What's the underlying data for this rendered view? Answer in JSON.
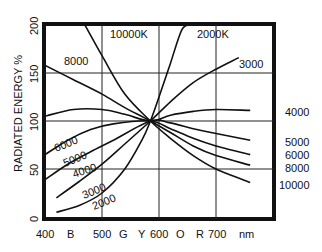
{
  "chart_data": {
    "type": "line",
    "title": "",
    "xlabel": "nm",
    "ylabel": "RADIATED ENERGY %",
    "xlim": [
      400,
      760
    ],
    "ylim": [
      0,
      200
    ],
    "grid": true,
    "x_ticks": [
      {
        "value": 400,
        "label": "400"
      },
      {
        "value": 450,
        "label": "B"
      },
      {
        "value": 500,
        "label": "500"
      },
      {
        "value": 530,
        "label": "G"
      },
      {
        "value": 570,
        "label": "Y"
      },
      {
        "value": 600,
        "label": "600"
      },
      {
        "value": 630,
        "label": "O"
      },
      {
        "value": 670,
        "label": "R"
      },
      {
        "value": 700,
        "label": "700"
      },
      {
        "value": 750,
        "label": "nm"
      }
    ],
    "y_ticks": [
      "0",
      "50",
      "100",
      "150",
      "200"
    ],
    "x_grid": [
      500,
      600,
      700
    ],
    "y_grid": [
      50,
      100,
      150
    ],
    "series": [
      {
        "name": "2000K",
        "label": "2000K",
        "points": [
          [
            420,
            5
          ],
          [
            460,
            12
          ],
          [
            500,
            25
          ],
          [
            540,
            50
          ],
          [
            570,
            80
          ],
          [
            585,
            100
          ],
          [
            600,
            125
          ],
          [
            620,
            160
          ],
          [
            640,
            195
          ],
          [
            655,
            200
          ]
        ]
      },
      {
        "name": "3000",
        "label": "3000",
        "points": [
          [
            420,
            20
          ],
          [
            460,
            37
          ],
          [
            500,
            55
          ],
          [
            540,
            76
          ],
          [
            585,
            100
          ],
          [
            620,
            120
          ],
          [
            660,
            140
          ],
          [
            700,
            154
          ],
          [
            740,
            166
          ]
        ]
      },
      {
        "name": "4000",
        "label": "4000",
        "points": [
          [
            400,
            105
          ],
          [
            450,
            112
          ],
          [
            500,
            112
          ],
          [
            540,
            107
          ],
          [
            585,
            100
          ],
          [
            620,
            106
          ],
          [
            660,
            110
          ],
          [
            700,
            112
          ],
          [
            760,
            111
          ]
        ]
      },
      {
        "name": "5000",
        "label": "5000",
        "points": [
          [
            400,
            39
          ],
          [
            440,
            55
          ],
          [
            480,
            68
          ],
          [
            520,
            80
          ],
          [
            585,
            100
          ],
          [
            620,
            98
          ],
          [
            660,
            92
          ],
          [
            700,
            87
          ],
          [
            760,
            80
          ]
        ]
      },
      {
        "name": "6000",
        "label": "6000",
        "points": [
          [
            400,
            65
          ],
          [
            440,
            80
          ],
          [
            480,
            91
          ],
          [
            520,
            97
          ],
          [
            585,
            100
          ],
          [
            620,
            92
          ],
          [
            660,
            82
          ],
          [
            700,
            74
          ],
          [
            760,
            65
          ]
        ]
      },
      {
        "name": "8000",
        "label": "8000",
        "points": [
          [
            400,
            158
          ],
          [
            450,
            143
          ],
          [
            500,
            128
          ],
          [
            540,
            114
          ],
          [
            585,
            100
          ],
          [
            620,
            88
          ],
          [
            660,
            74
          ],
          [
            700,
            64
          ],
          [
            760,
            54
          ]
        ]
      },
      {
        "name": "10000K",
        "label": "10000K",
        "points": [
          [
            470,
            200
          ],
          [
            500,
            168
          ],
          [
            540,
            128
          ],
          [
            585,
            100
          ],
          [
            620,
            82
          ],
          [
            660,
            64
          ],
          [
            700,
            50
          ],
          [
            760,
            36
          ]
        ]
      }
    ],
    "annotations": [
      {
        "text": "10000K",
        "position": "top"
      },
      {
        "text": "2000K",
        "position": "top-right"
      },
      {
        "text": "8000",
        "position": "upper-left"
      },
      {
        "text": "3000",
        "position": "upper-right"
      },
      {
        "text": "4000",
        "position": "right"
      },
      {
        "text": "6000",
        "position": "left"
      },
      {
        "text": "5000",
        "position": "left"
      },
      {
        "text": "4000",
        "position": "left"
      },
      {
        "text": "3000",
        "position": "lower-left"
      },
      {
        "text": "2000",
        "position": "lower-left"
      },
      {
        "text": "5000",
        "position": "right"
      },
      {
        "text": "6000",
        "position": "right"
      },
      {
        "text": "8000",
        "position": "right"
      },
      {
        "text": "10000",
        "position": "right"
      }
    ]
  },
  "labels": {
    "top_10000": "10000K",
    "top_2000": "2000K",
    "l_8000": "8000",
    "r_3000": "3000",
    "r_4000": "4000",
    "l_6000": "6000",
    "l_5000": "5000",
    "l_4000": "4000",
    "l_3000": "3000",
    "l_2000": "2000",
    "r_5000": "5000",
    "r_6000": "6000",
    "r_8000": "8000",
    "r_10000": "10000",
    "ylabel": "RADIATED ENERGY  %",
    "y0": "0",
    "y50": "50",
    "y100": "100",
    "y150": "150",
    "y200": "200",
    "x400": "400",
    "xB": "B",
    "x500": "500",
    "xG": "G",
    "xY": "Y",
    "x600": "600",
    "xO": "O",
    "xR": "R",
    "x700": "700",
    "xnm": "nm"
  }
}
